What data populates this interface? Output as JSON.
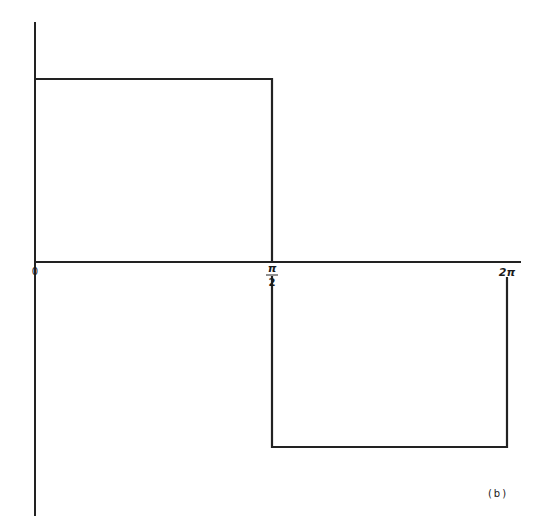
{
  "figure": {
    "panel_label": "(b)"
  },
  "axes": {
    "x_ticks": [
      {
        "label": "0",
        "x": 35
      },
      {
        "label_num": "π",
        "label_den": "2",
        "x": 272
      },
      {
        "label": "2π",
        "x": 507
      }
    ]
  },
  "waveform": {
    "segments": [
      {
        "from": "0",
        "to": "π/2",
        "level": "high"
      },
      {
        "from": "π/2",
        "to": "2π",
        "level": "low"
      }
    ]
  },
  "colors": {
    "stroke": "#222222",
    "background": "#ffffff"
  }
}
